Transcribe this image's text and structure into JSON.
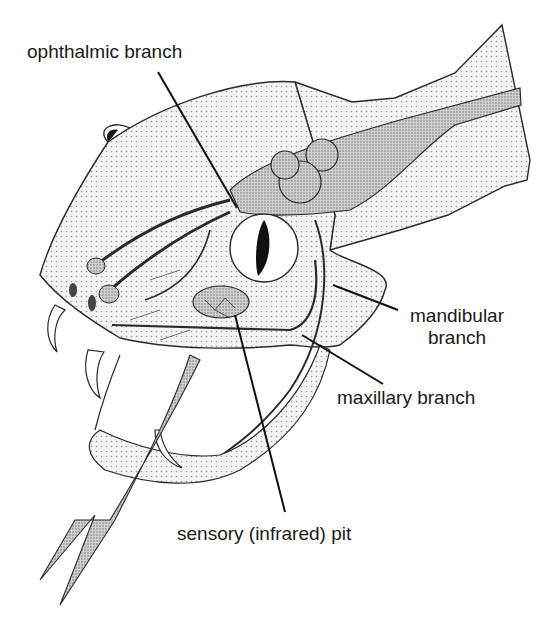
{
  "diagram": {
    "colors": {
      "outline": "#2a2a2a",
      "skin_fill": "#ececec",
      "nerve_fill": "#bdbdbd",
      "ganglion_fill": "#c8c8c8",
      "eye_fill": "#ffffff",
      "pupil": "#111111",
      "leader_line": "#111111",
      "text": "#1a1a1a"
    },
    "labels": {
      "ophthalmic": "ophthalmic branch",
      "mandibular_line1": "mandibular",
      "mandibular_line2": "branch",
      "maxillary": "maxillary branch",
      "pit": "sensory (infrared) pit"
    }
  }
}
